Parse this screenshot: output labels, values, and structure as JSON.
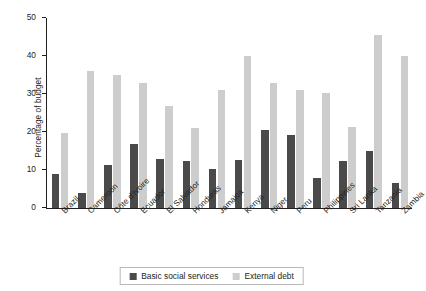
{
  "chart_data": {
    "type": "bar",
    "title": "",
    "subtitle": "",
    "xlabel": "",
    "ylabel": "Percentage of budget",
    "ylim": [
      0,
      50
    ],
    "yticks": [
      0,
      10,
      20,
      30,
      40,
      50
    ],
    "ytick_labels": [
      "0",
      "10",
      "20",
      "30",
      "40",
      "50"
    ],
    "grid": false,
    "legend_position": "bottom-center",
    "categories": [
      "Brazil",
      "Cameroon",
      "Côte d'Ivoire",
      "Ecuador",
      "El Salvador",
      "Honduras",
      "Jamaica",
      "Kenya",
      "Niger",
      "Peru",
      "Philippines",
      "Sri Lanka",
      "Tanzania",
      "Zambia"
    ],
    "series": [
      {
        "name": "Basic social services",
        "color": "#4a4a4a",
        "values": [
          8.9,
          4.0,
          11.4,
          16.9,
          13.0,
          12.5,
          10.2,
          12.6,
          20.4,
          19.3,
          7.8,
          12.5,
          14.9,
          6.7
        ]
      },
      {
        "name": "External debt",
        "color": "#cdcdcd",
        "values": [
          19.8,
          36.0,
          34.9,
          33.0,
          26.8,
          21.0,
          31.1,
          40.0,
          33.0,
          31.0,
          30.3,
          21.4,
          45.5,
          40.1
        ]
      }
    ]
  },
  "legend": {
    "entries": [
      {
        "label": "Basic social services",
        "color": "#4a4a4a"
      },
      {
        "label": "External debt",
        "color": "#cdcdcd"
      }
    ]
  },
  "axis": {
    "y_title": "Percentage of budget"
  }
}
